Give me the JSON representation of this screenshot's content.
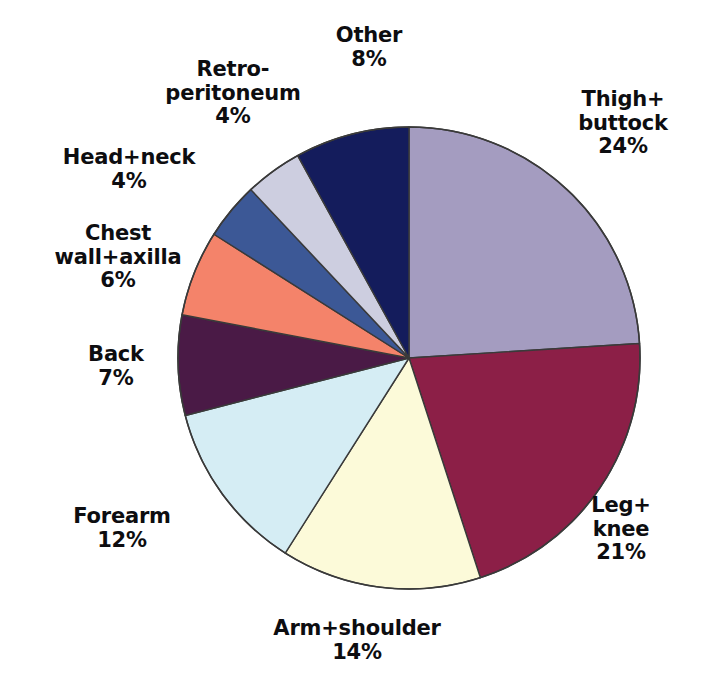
{
  "chart_data": {
    "type": "pie",
    "title": "",
    "subtitle": "",
    "xlabel": "",
    "ylabel": "",
    "legend_position": "none",
    "grid": false,
    "value_unit": "%",
    "start_angle_deg": 0,
    "direction": "clockwise",
    "categories": [
      "Thigh+buttock",
      "Leg+knee",
      "Arm+shoulder",
      "Forearm",
      "Back",
      "Chest wall+axilla",
      "Head+neck",
      "Retro-peritoneum",
      "Other"
    ],
    "values": [
      24,
      21,
      14,
      12,
      7,
      6,
      4,
      4,
      8
    ],
    "total": 100,
    "colors": [
      "#a49cc0",
      "#8c1f47",
      "#fcfad9",
      "#d5edf4",
      "#4a1a46",
      "#f4836a",
      "#3c5896",
      "#cdcee0",
      "#141c5c"
    ],
    "slices": [
      {
        "name": "Thigh+buttock",
        "value": 24,
        "percent_text": "24%",
        "color": "#a49cc0"
      },
      {
        "name": "Leg+knee",
        "value": 21,
        "percent_text": "21%",
        "color": "#8c1f47"
      },
      {
        "name": "Arm+shoulder",
        "value": 14,
        "percent_text": "14%",
        "color": "#fcfad9"
      },
      {
        "name": "Forearm",
        "value": 12,
        "percent_text": "12%",
        "color": "#d5edf4"
      },
      {
        "name": "Back",
        "value": 7,
        "percent_text": "7%",
        "color": "#4a1a46"
      },
      {
        "name": "Chest wall+axilla",
        "value": 6,
        "percent_text": "6%",
        "color": "#f4836a"
      },
      {
        "name": "Head+neck",
        "value": 4,
        "percent_text": "4%",
        "color": "#3c5896"
      },
      {
        "name": "Retro-peritoneum",
        "value": 4,
        "percent_text": "4%",
        "color": "#cdcee0"
      },
      {
        "name": "Other",
        "value": 8,
        "percent_text": "8%",
        "color": "#141c5c"
      }
    ]
  },
  "labels": {
    "other": {
      "line1": "Other",
      "pct": "8%"
    },
    "retro": {
      "line1": "Retro-",
      "line2": "peritoneum",
      "pct": "4%"
    },
    "head_neck": {
      "line1": "Head+neck",
      "pct": "4%"
    },
    "chest_wall": {
      "line1": "Chest",
      "line2": "wall+axilla",
      "pct": "6%"
    },
    "back": {
      "line1": "Back",
      "pct": "7%"
    },
    "forearm": {
      "line1": "Forearm",
      "pct": "12%"
    },
    "arm_shoulder": {
      "line1": "Arm+shoulder",
      "pct": "14%"
    },
    "leg_knee": {
      "line1": "Leg+",
      "line2": "knee",
      "pct": "21%"
    },
    "thigh": {
      "line1": "Thigh+",
      "line2": "buttock",
      "pct": "24%"
    }
  },
  "style": {
    "background": "#ffffff",
    "text_color": "#0d0d10",
    "slice_outline": "#3a3a3a"
  }
}
